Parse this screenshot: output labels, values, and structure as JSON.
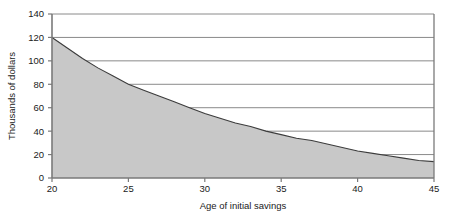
{
  "chart_data": {
    "type": "area",
    "title": "",
    "xlabel": "Age of initial savings",
    "ylabel": "Thousands of dollars",
    "xlim": [
      20,
      45
    ],
    "ylim": [
      0,
      140
    ],
    "xticks": [
      20,
      25,
      30,
      35,
      40,
      45
    ],
    "yticks": [
      0,
      20,
      40,
      60,
      80,
      100,
      120,
      140
    ],
    "xtick_labels": [
      "20",
      "25",
      "30",
      "35",
      "40",
      "45"
    ],
    "ytick_labels": [
      "0",
      "20",
      "40",
      "60",
      "80",
      "100",
      "120",
      "140"
    ],
    "grid": "horizontal",
    "legend": "none",
    "x": [
      20,
      21,
      22,
      23,
      24,
      25,
      26,
      27,
      28,
      29,
      30,
      31,
      32,
      33,
      34,
      35,
      36,
      37,
      38,
      39,
      40,
      41,
      42,
      43,
      44,
      45
    ],
    "values": [
      120,
      111,
      102,
      94,
      87,
      80,
      75,
      70,
      65,
      60,
      55,
      51,
      47,
      44,
      40,
      37,
      34,
      32,
      29,
      26,
      23,
      21,
      19,
      17,
      15,
      14
    ],
    "series": [
      {
        "name": "Savings needed",
        "values": [
          120,
          111,
          102,
          94,
          87,
          80,
          75,
          70,
          65,
          60,
          55,
          51,
          47,
          44,
          40,
          37,
          34,
          32,
          29,
          26,
          23,
          21,
          19,
          17,
          15,
          14
        ]
      }
    ],
    "fill_color": "#c8c8c8",
    "line_color": "#3c3c3c",
    "grid_color": "#8a8a8a",
    "axis_color": "#7a7a7a"
  }
}
